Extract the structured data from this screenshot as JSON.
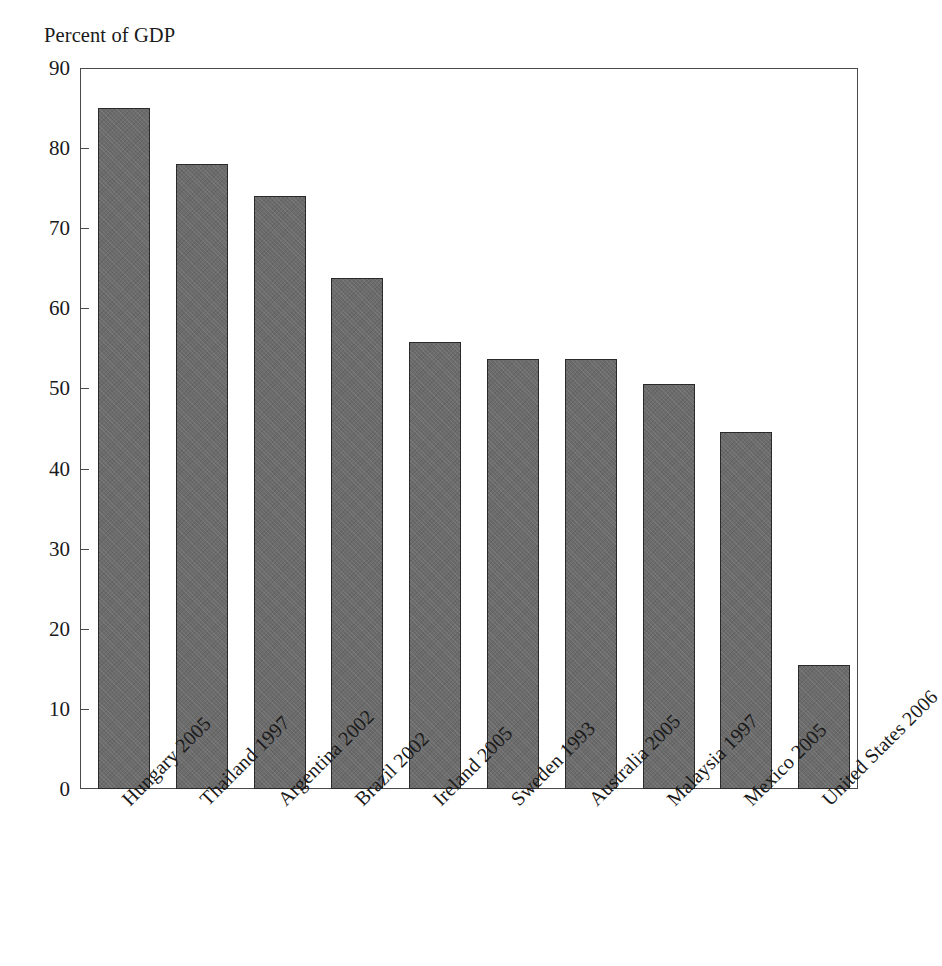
{
  "top_clipped_line": "",
  "chart_data": {
    "type": "bar",
    "title": "",
    "subtitle": "",
    "ylabel": "Percent of GDP",
    "xlabel": "",
    "ylim": [
      0,
      90
    ],
    "yticks": [
      0,
      10,
      20,
      30,
      40,
      50,
      60,
      70,
      80,
      90
    ],
    "ytick_labels": [
      "0",
      "10",
      "20",
      "30",
      "40",
      "50",
      "60",
      "70",
      "80",
      "90"
    ],
    "grid": false,
    "legend": null,
    "legend_position": "none",
    "bar_fill_color": "#6b6b6b",
    "bar_edge_color": "#2a2a2a",
    "axis_color": "#4a4a4a",
    "background_color": "#ffffff",
    "categories": [
      "Hungary 2005",
      "Thailand 1997",
      "Argentina 2002",
      "Brazil 2002",
      "Ireland 2005",
      "Sweden 1993",
      "Australia 2005",
      "Malaysia 1997",
      "Mexico 2005",
      "United States 2006"
    ],
    "values": [
      85.0,
      78.0,
      74.0,
      63.8,
      55.8,
      53.7,
      53.7,
      50.6,
      44.6,
      15.5
    ]
  }
}
